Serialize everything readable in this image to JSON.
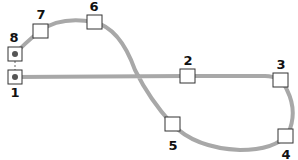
{
  "diagram": {
    "type": "track-loop",
    "track_color": "#a8a8a8",
    "nodes": [
      {
        "id": "1",
        "label": "1",
        "x": 15,
        "y": 77,
        "filled_dot": true
      },
      {
        "id": "2",
        "label": "2",
        "x": 187,
        "y": 76,
        "filled_dot": false
      },
      {
        "id": "3",
        "label": "3",
        "x": 280,
        "y": 79,
        "filled_dot": false
      },
      {
        "id": "4",
        "label": "4",
        "x": 285,
        "y": 136,
        "filled_dot": false
      },
      {
        "id": "5",
        "label": "5",
        "x": 172,
        "y": 124,
        "filled_dot": false
      },
      {
        "id": "6",
        "label": "6",
        "x": 94,
        "y": 22,
        "filled_dot": false
      },
      {
        "id": "7",
        "label": "7",
        "x": 40,
        "y": 31,
        "filled_dot": false
      },
      {
        "id": "8",
        "label": "8",
        "x": 15,
        "y": 54,
        "filled_dot": true
      }
    ]
  }
}
